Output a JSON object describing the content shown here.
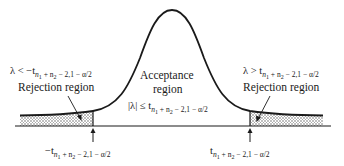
{
  "diagram": {
    "type": "two-tailed t-test decision regions",
    "curve": "t-distribution bell curve",
    "stroke_color": "#1a1a1a",
    "shade_color": "#bdbdbd"
  },
  "labels": {
    "acceptance_line1": "Acceptance",
    "acceptance_line2": "region",
    "acceptance_condition": "|λ| ≤ t",
    "left_rejection_title": "Rejection region",
    "left_rejection_condition": "λ < −t",
    "right_rejection_title": "Rejection region",
    "right_rejection_condition": "λ > t",
    "left_critical_value": "−t",
    "right_critical_value": "t",
    "subscript": "n₁ + n₂ − 2,1 − α/2",
    "subscript_main": "n",
    "subscript_rest": "+ n",
    "subscript_tail": " − 2,1 − α/2"
  }
}
